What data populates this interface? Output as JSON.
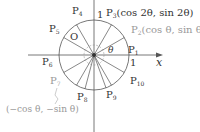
{
  "diagram": {
    "type": "unit-circle",
    "axis_x_label": "x",
    "unit_label_x": "1",
    "unit_label_y": "1",
    "origin_label": "O",
    "angle_label": "θ",
    "points": [
      {
        "id": "P1",
        "sub": "1",
        "angle_deg": 0
      },
      {
        "id": "P2",
        "sub": "2",
        "angle_deg": 30
      },
      {
        "id": "P3",
        "sub": "3",
        "angle_deg": 60
      },
      {
        "id": "P4",
        "sub": "4",
        "angle_deg": 90
      },
      {
        "id": "P5",
        "sub": "5",
        "angle_deg": 120
      },
      {
        "id": "P6",
        "sub": "6",
        "angle_deg": 180
      },
      {
        "id": "P7",
        "sub": "7",
        "angle_deg": 210
      },
      {
        "id": "P8",
        "sub": "8",
        "angle_deg": 255
      },
      {
        "id": "P9",
        "sub": "9",
        "angle_deg": 290
      },
      {
        "id": "P10",
        "sub": "10",
        "angle_deg": 330
      }
    ],
    "annotations": {
      "p3": "(cos 2θ, sin 2θ)",
      "p2": "(cos θ, sin θ)",
      "p7": "(−cos θ, −sin θ)"
    }
  }
}
